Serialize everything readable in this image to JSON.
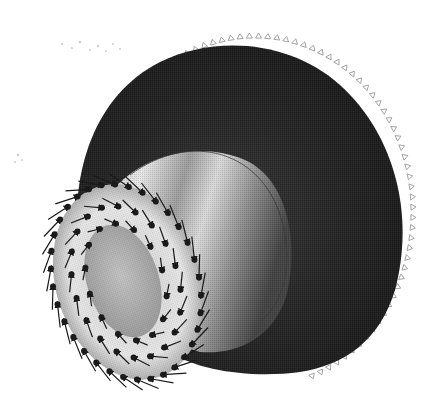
{
  "figure": {
    "subject": "FEA model of stepped cylindrical part with loads and constraints",
    "background": "#ffffff",
    "colors": {
      "flange_dark": "#1f1f1f",
      "flange_mid": "#2e2e2e",
      "hub_light": "#e2e2e2",
      "hub_mid": "#a8a8a8",
      "hub_dark": "#5a5a5a",
      "bore_face": "#b5b5b5",
      "arrow": "#1a1a1a",
      "constraint_marker": "#9a9a9a",
      "contour_line": "#3a3a3a",
      "noise_speck": "#cfcfcf"
    },
    "flange": {
      "cx": 255,
      "cy": 225,
      "rx": 152,
      "ry": 176
    },
    "hub": {
      "cx": 150,
      "cy": 262,
      "rx": 78,
      "ry": 105
    },
    "bore": {
      "cx": 127,
      "cy": 283,
      "rx": 38,
      "ry": 60
    },
    "load_arrows": {
      "count": 64,
      "label": ""
    },
    "constraint_markers": {
      "count": 60,
      "label": ""
    }
  }
}
